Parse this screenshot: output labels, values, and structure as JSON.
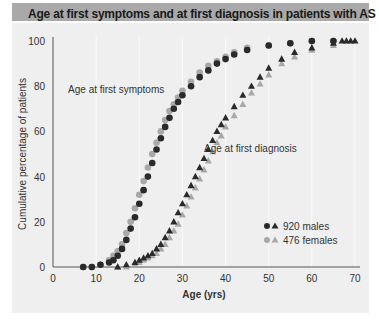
{
  "header": {
    "title": "Age at first symptoms and at first diagnosis in patients with AS"
  },
  "chart_data": {
    "type": "scatter",
    "title": "Age at first symptoms and at first diagnosis in patients with AS",
    "xlabel": "Age (yrs)",
    "ylabel": "Cumulative percentage of patients",
    "xlim": [
      0,
      70
    ],
    "ylim": [
      0,
      100
    ],
    "xticks": [
      0,
      10,
      20,
      30,
      40,
      50,
      60,
      70
    ],
    "yticks": [
      0,
      20,
      40,
      60,
      80,
      100
    ],
    "grid": "faint vertical",
    "annotations": [
      {
        "text": "Age at first symptoms",
        "x": 3.5,
        "y": 77
      },
      {
        "text": "Age at first diagnosis",
        "x": 35,
        "y": 51
      }
    ],
    "legend": {
      "position": "lower right",
      "entries": [
        "920 males",
        "476 females"
      ]
    },
    "series": [
      {
        "name": "Symptoms - males",
        "marker": "circle",
        "color": "#2a2a2a",
        "x": [
          7,
          9,
          11,
          13,
          14,
          15,
          16,
          17,
          18,
          19,
          20,
          21,
          22,
          23,
          24,
          25,
          26,
          27,
          28,
          29,
          30,
          32,
          34,
          36,
          38,
          40,
          42,
          45,
          50,
          55,
          60,
          65
        ],
        "y": [
          0,
          0,
          1,
          2,
          3,
          5,
          8,
          12,
          17,
          22,
          28,
          34,
          40,
          46,
          52,
          57,
          62,
          66,
          70,
          73,
          76,
          80,
          84,
          87,
          90,
          92,
          94,
          96,
          98,
          99,
          100,
          100
        ]
      },
      {
        "name": "Symptoms - females",
        "marker": "circle",
        "color": "#a8a8a8",
        "x": [
          7,
          9,
          11,
          13,
          14,
          15,
          16,
          17,
          18,
          19,
          20,
          21,
          22,
          23,
          24,
          25,
          26,
          27,
          28,
          29,
          30,
          32,
          34,
          36,
          38,
          40,
          42,
          45,
          50,
          55,
          60,
          65
        ],
        "y": [
          0,
          0,
          1,
          3,
          5,
          7,
          10,
          15,
          20,
          26,
          32,
          38,
          44,
          50,
          55,
          60,
          65,
          69,
          72,
          75,
          78,
          82,
          86,
          89,
          91,
          93,
          95,
          97,
          98,
          99,
          100,
          100
        ]
      },
      {
        "name": "Diagnosis - males",
        "marker": "triangle",
        "color": "#2a2a2a",
        "x": [
          15,
          17,
          19,
          20,
          21,
          22,
          23,
          24,
          25,
          26,
          27,
          28,
          29,
          30,
          31,
          32,
          33,
          34,
          35,
          36,
          37,
          38,
          39,
          40,
          42,
          44,
          46,
          48,
          50,
          53,
          56,
          60,
          65,
          67,
          68,
          69,
          70
        ],
        "y": [
          0,
          1,
          2,
          3,
          4,
          5,
          6,
          8,
          10,
          13,
          16,
          20,
          24,
          28,
          32,
          36,
          40,
          44,
          48,
          52,
          56,
          60,
          63,
          66,
          71,
          76,
          80,
          84,
          88,
          92,
          95,
          97,
          99,
          100,
          100,
          100,
          100
        ]
      },
      {
        "name": "Diagnosis - females",
        "marker": "triangle",
        "color": "#a8a8a8",
        "x": [
          15,
          17,
          19,
          20,
          21,
          22,
          23,
          24,
          25,
          26,
          27,
          28,
          29,
          30,
          31,
          32,
          33,
          34,
          35,
          36,
          37,
          38,
          39,
          40,
          42,
          44,
          46,
          48,
          50,
          53,
          56,
          60,
          65
        ],
        "y": [
          0,
          0,
          1,
          2,
          3,
          4,
          5,
          6,
          8,
          10,
          13,
          16,
          19,
          23,
          27,
          31,
          35,
          39,
          43,
          47,
          51,
          55,
          58,
          62,
          67,
          72,
          77,
          81,
          85,
          90,
          93,
          96,
          98
        ]
      }
    ]
  }
}
